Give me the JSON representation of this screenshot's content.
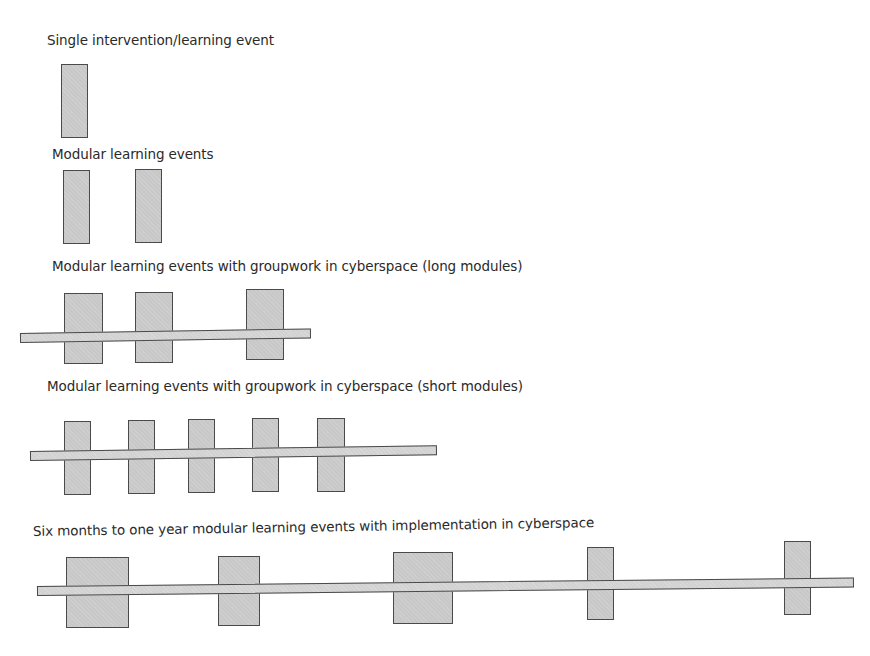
{
  "diagram": {
    "sections": [
      {
        "id": "single",
        "label": "Single intervention/learning event"
      },
      {
        "id": "modular",
        "label": "Modular learning events"
      },
      {
        "id": "long",
        "label": "Modular learning events with groupwork in cyberspace (long modules)"
      },
      {
        "id": "short",
        "label": "Modular learning events with groupwork in cyberspace (short modules)"
      },
      {
        "id": "year",
        "label": "Six months to one year modular learning events with implementation in cyberspace"
      }
    ],
    "colors": {
      "fill": "#c8c8c8",
      "stroke": "#4a4a4a",
      "text": "#2a2a2a"
    }
  }
}
